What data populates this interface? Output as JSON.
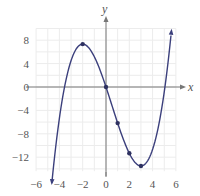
{
  "chart_data": {
    "type": "line",
    "title": "",
    "xlabel": "x",
    "ylabel": "y",
    "xlim": [
      -6,
      6
    ],
    "ylim": [
      -14.4,
      10
    ],
    "grid": true,
    "x_ticks": [
      -6,
      -4,
      -2,
      0,
      2,
      4,
      6
    ],
    "y_ticks": [
      8,
      4,
      0,
      -4,
      -8,
      -12
    ],
    "x_tick_labels": [
      "−6",
      "−4",
      "−2",
      "0",
      "2",
      "4",
      "6"
    ],
    "y_tick_labels": [
      "8",
      "4",
      "0",
      "−4",
      "−8",
      "−12"
    ],
    "function": "y = x^3/3 - x^2/2 - 6x",
    "series": [
      {
        "name": "f(x)",
        "color": "#3b3f7c",
        "x": [
          -4.65,
          -4,
          -3.5,
          -3,
          -2.5,
          -2,
          -1.5,
          -1,
          -0.5,
          0,
          0.5,
          1,
          1.5,
          2,
          2.5,
          3,
          3.5,
          4,
          4.5,
          5,
          5.5,
          5.75
        ],
        "y": [
          -13.0,
          -5.33,
          0.54,
          4.5,
          6.67,
          7.33,
          6.75,
          5.17,
          2.83,
          0,
          -3.08,
          -6.17,
          -9.0,
          -11.33,
          -12.92,
          -13.5,
          -12.83,
          -10.67,
          -6.75,
          -0.83,
          7.35,
          11.9
        ]
      }
    ],
    "marked_points": [
      {
        "x": -2,
        "y": 7.33
      },
      {
        "x": 0,
        "y": 0
      },
      {
        "x": 1,
        "y": -6.17
      },
      {
        "x": 2,
        "y": -11.33
      },
      {
        "x": 3,
        "y": -13.5
      }
    ],
    "x_intercepts": [
      -3.56,
      0,
      5.06
    ],
    "local_max": {
      "x": -2,
      "y": 7.33
    },
    "local_min": {
      "x": 3,
      "y": -13.5
    }
  }
}
